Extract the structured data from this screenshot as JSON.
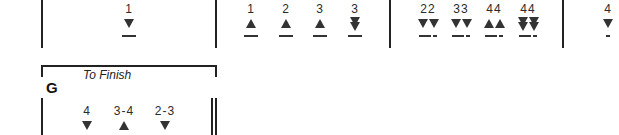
{
  "row1": {
    "boxes": [
      {
        "items": [
          {
            "label": "1",
            "marks": [
              "down"
            ],
            "dash": "single"
          }
        ]
      },
      {
        "items": [
          {
            "label": "1",
            "marks": [
              "up"
            ],
            "dash": "single"
          },
          {
            "label": "2",
            "marks": [
              "up"
            ],
            "dash": "single"
          },
          {
            "label": "3",
            "marks": [
              "up"
            ],
            "dash": "single"
          },
          {
            "label": "3",
            "marks": [
              "double-down"
            ],
            "dash": "single"
          }
        ]
      },
      {
        "items": [
          {
            "label": "22",
            "marks": [
              "down",
              "down"
            ],
            "dash": "long-short"
          },
          {
            "label": "33",
            "marks": [
              "down",
              "down"
            ],
            "dash": "long-short"
          },
          {
            "label": "44",
            "marks": [
              "up",
              "up"
            ],
            "dash": "long-short"
          },
          {
            "label": "44",
            "marks": [
              "double-down",
              "double-down"
            ],
            "dash": "long-short"
          }
        ]
      },
      {
        "items": [
          {
            "label": "4",
            "marks": [
              "down"
            ],
            "dash": "short"
          }
        ]
      }
    ]
  },
  "section_g": {
    "letter": "G",
    "title": "To Finish",
    "items": [
      {
        "label": "4",
        "marks": [
          "down"
        ]
      },
      {
        "label": "3-4",
        "marks": [
          "up"
        ]
      },
      {
        "label": "2-3",
        "marks": [
          "down"
        ]
      }
    ]
  }
}
